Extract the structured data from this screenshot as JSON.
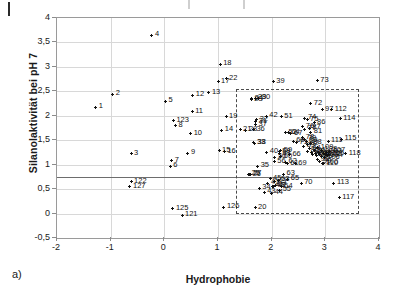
{
  "figure": {
    "panel_label": "a)"
  },
  "chart_data": {
    "type": "scatter",
    "title": "",
    "xlabel": "Hydrophobie",
    "ylabel": "Silanolaktivität bei pH 7",
    "xlim": [
      -2,
      4
    ],
    "ylim": [
      -0.5,
      4
    ],
    "xticks": [
      "-2",
      "-1",
      "0",
      "1",
      "2",
      "3",
      "4"
    ],
    "xtick_values": [
      -2,
      -1,
      0,
      1,
      2,
      3,
      4
    ],
    "yticks": [
      "-0,5",
      "0",
      "0,5",
      "1",
      "1,5",
      "2",
      "2,5",
      "3",
      "3,5",
      "4"
    ],
    "ytick_values": [
      -0.5,
      0,
      0.5,
      1,
      1.5,
      2,
      2.5,
      3,
      3.5,
      4
    ],
    "grid": true,
    "legend": "none",
    "annotations": [
      {
        "type": "hline",
        "name": "threshold-line",
        "y": 0.75,
        "style": "solid"
      },
      {
        "type": "rect",
        "name": "selection-box",
        "x0": 1.33,
        "x1": 3.63,
        "y0": 0.0,
        "y1": 2.55,
        "style": "dashed"
      }
    ],
    "point_label_format": "number",
    "points": [
      {
        "label": "1",
        "x": -1.28,
        "y": 2.17
      },
      {
        "label": "2",
        "x": -0.96,
        "y": 2.44
      },
      {
        "label": "3",
        "x": -0.62,
        "y": 1.22
      },
      {
        "label": "4",
        "x": -0.23,
        "y": 3.65
      },
      {
        "label": "5",
        "x": 0.02,
        "y": 2.3
      },
      {
        "label": "6",
        "x": 0.11,
        "y": 0.97
      },
      {
        "label": "7",
        "x": 0.14,
        "y": 1.08
      },
      {
        "label": "8",
        "x": 0.21,
        "y": 1.8
      },
      {
        "label": "9",
        "x": 0.44,
        "y": 1.23
      },
      {
        "label": "10",
        "x": 0.49,
        "y": 1.63
      },
      {
        "label": "11",
        "x": 0.52,
        "y": 2.08
      },
      {
        "label": "12",
        "x": 0.53,
        "y": 2.42
      },
      {
        "label": "13",
        "x": 0.83,
        "y": 2.47
      },
      {
        "label": "14",
        "x": 1.07,
        "y": 1.7
      },
      {
        "label": "15",
        "x": 1.02,
        "y": 1.28
      },
      {
        "label": "16",
        "x": 1.12,
        "y": 1.26
      },
      {
        "label": "17",
        "x": 1.0,
        "y": 2.7
      },
      {
        "label": "18",
        "x": 1.04,
        "y": 3.05
      },
      {
        "label": "19",
        "x": 1.15,
        "y": 1.98
      },
      {
        "label": "20",
        "x": 1.69,
        "y": 0.12
      },
      {
        "label": "21",
        "x": 1.41,
        "y": 1.71
      },
      {
        "label": "22",
        "x": 1.15,
        "y": 2.76
      },
      {
        "label": "23",
        "x": 1.62,
        "y": 2.33
      },
      {
        "label": "24",
        "x": 1.63,
        "y": 2.35
      },
      {
        "label": "25",
        "x": 1.57,
        "y": 0.8
      },
      {
        "label": "26",
        "x": 1.59,
        "y": 0.79
      },
      {
        "label": "27",
        "x": 1.6,
        "y": 0.8
      },
      {
        "label": "28",
        "x": 1.52,
        "y": 1.7
      },
      {
        "label": "29",
        "x": 1.69,
        "y": 2.36
      },
      {
        "label": "30",
        "x": 1.76,
        "y": 2.36
      },
      {
        "label": "31",
        "x": 1.7,
        "y": 1.88
      },
      {
        "label": "32",
        "x": 1.72,
        "y": 1.92
      },
      {
        "label": "33",
        "x": 1.67,
        "y": 1.45
      },
      {
        "label": "34",
        "x": 1.77,
        "y": 0.52
      },
      {
        "label": "35",
        "x": 1.74,
        "y": 0.97
      },
      {
        "label": "36",
        "x": 1.66,
        "y": 1.71
      },
      {
        "label": "37",
        "x": 1.7,
        "y": 1.82
      },
      {
        "label": "38",
        "x": 1.68,
        "y": 1.44
      },
      {
        "label": "39",
        "x": 2.03,
        "y": 2.7
      },
      {
        "label": "40",
        "x": 1.91,
        "y": 1.25
      },
      {
        "label": "41",
        "x": 1.93,
        "y": 0.62
      },
      {
        "label": "42",
        "x": 1.9,
        "y": 1.99
      },
      {
        "label": "43",
        "x": 1.86,
        "y": 0.44
      },
      {
        "label": "44",
        "x": 2.0,
        "y": 0.42
      },
      {
        "label": "45",
        "x": 1.97,
        "y": 0.71
      },
      {
        "label": "46",
        "x": 2.02,
        "y": 0.56
      },
      {
        "label": "47",
        "x": 2.07,
        "y": 0.57
      },
      {
        "label": "48",
        "x": 2.04,
        "y": 0.56
      },
      {
        "label": "49",
        "x": 2.06,
        "y": 0.65
      },
      {
        "label": "50",
        "x": 2.06,
        "y": 1.15
      },
      {
        "label": "51",
        "x": 2.18,
        "y": 1.98
      },
      {
        "label": "52",
        "x": 2.26,
        "y": 1.65
      },
      {
        "label": "53",
        "x": 2.12,
        "y": 0.68
      },
      {
        "label": "54",
        "x": 2.18,
        "y": 0.55
      },
      {
        "label": "55",
        "x": 2.15,
        "y": 0.48
      },
      {
        "label": "56",
        "x": 2.05,
        "y": 1.06
      },
      {
        "label": "57",
        "x": 2.14,
        "y": 1.22
      },
      {
        "label": "58",
        "x": 2.14,
        "y": 1.26
      },
      {
        "label": "59",
        "x": 2.17,
        "y": 1.28
      },
      {
        "label": "60",
        "x": 2.17,
        "y": 1.16
      },
      {
        "label": "61",
        "x": 2.29,
        "y": 1.02
      },
      {
        "label": "62",
        "x": 2.26,
        "y": 1.05
      },
      {
        "label": "63",
        "x": 2.22,
        "y": 0.8
      },
      {
        "label": "64",
        "x": 2.31,
        "y": 1.65
      },
      {
        "label": "65",
        "x": 2.3,
        "y": 0.7
      },
      {
        "label": "66",
        "x": 2.33,
        "y": 1.2
      },
      {
        "label": "67",
        "x": 2.36,
        "y": 1.63
      },
      {
        "label": "68",
        "x": 2.4,
        "y": 1.48
      },
      {
        "label": "69",
        "x": 2.44,
        "y": 1.02
      },
      {
        "label": "70",
        "x": 2.55,
        "y": 0.62
      },
      {
        "label": "71",
        "x": 2.46,
        "y": 1.45
      },
      {
        "label": "72",
        "x": 2.73,
        "y": 2.25
      },
      {
        "label": "73",
        "x": 2.85,
        "y": 2.72
      },
      {
        "label": "74",
        "x": 2.62,
        "y": 1.95
      },
      {
        "label": "75",
        "x": 2.66,
        "y": 1.92
      },
      {
        "label": "76",
        "x": 2.58,
        "y": 1.78
      },
      {
        "label": "77",
        "x": 2.62,
        "y": 1.72
      },
      {
        "label": "78",
        "x": 2.58,
        "y": 1.55
      },
      {
        "label": "79",
        "x": 2.62,
        "y": 1.52
      },
      {
        "label": "80",
        "x": 2.64,
        "y": 1.48
      },
      {
        "label": "81",
        "x": 2.73,
        "y": 1.66
      },
      {
        "label": "82",
        "x": 2.66,
        "y": 1.42
      },
      {
        "label": "83",
        "x": 2.6,
        "y": 1.38
      },
      {
        "label": "84",
        "x": 2.7,
        "y": 1.33
      },
      {
        "label": "85",
        "x": 2.67,
        "y": 1.27
      },
      {
        "label": "86",
        "x": 2.79,
        "y": 1.86
      },
      {
        "label": "87",
        "x": 2.7,
        "y": 1.75
      },
      {
        "label": "88",
        "x": 2.72,
        "y": 1.44
      },
      {
        "label": "89",
        "x": 2.74,
        "y": 1.25
      },
      {
        "label": "90",
        "x": 2.76,
        "y": 1.2
      },
      {
        "label": "91",
        "x": 2.8,
        "y": 1.28
      },
      {
        "label": "92",
        "x": 2.82,
        "y": 1.22
      },
      {
        "label": "93",
        "x": 2.84,
        "y": 1.18
      },
      {
        "label": "94",
        "x": 2.88,
        "y": 1.24
      },
      {
        "label": "95",
        "x": 2.9,
        "y": 1.2
      },
      {
        "label": "96",
        "x": 2.92,
        "y": 1.16
      },
      {
        "label": "97",
        "x": 2.94,
        "y": 2.12
      },
      {
        "label": "98",
        "x": 2.86,
        "y": 1.1
      },
      {
        "label": "99",
        "x": 2.9,
        "y": 1.06
      },
      {
        "label": "100",
        "x": 2.95,
        "y": 1.03
      },
      {
        "label": "101",
        "x": 2.97,
        "y": 1.22
      },
      {
        "label": "102",
        "x": 3.0,
        "y": 1.2
      },
      {
        "label": "103",
        "x": 3.02,
        "y": 1.25
      },
      {
        "label": "104",
        "x": 3.04,
        "y": 1.18
      },
      {
        "label": "105",
        "x": 3.06,
        "y": 1.21
      },
      {
        "label": "106",
        "x": 2.98,
        "y": 1.14
      },
      {
        "label": "107",
        "x": 3.08,
        "y": 1.27
      },
      {
        "label": "108",
        "x": 2.93,
        "y": 1.3
      },
      {
        "label": "109",
        "x": 2.86,
        "y": 1.35
      },
      {
        "label": "110",
        "x": 2.96,
        "y": 1.02
      },
      {
        "label": "111",
        "x": 3.05,
        "y": 1.48
      },
      {
        "label": "112",
        "x": 3.12,
        "y": 2.12
      },
      {
        "label": "113",
        "x": 3.16,
        "y": 0.62
      },
      {
        "label": "114",
        "x": 3.28,
        "y": 1.94
      },
      {
        "label": "115",
        "x": 3.3,
        "y": 1.52
      },
      {
        "label": "117",
        "x": 3.26,
        "y": 0.32
      },
      {
        "label": "118",
        "x": 3.38,
        "y": 1.22
      },
      {
        "label": "121",
        "x": 0.33,
        "y": -0.03
      },
      {
        "label": "122",
        "x": -0.62,
        "y": 0.65
      },
      {
        "label": "123",
        "x": 0.17,
        "y": 1.9
      },
      {
        "label": "125",
        "x": 0.16,
        "y": 0.1
      },
      {
        "label": "126",
        "x": 1.11,
        "y": 0.13
      },
      {
        "label": "127",
        "x": -0.64,
        "y": 0.55
      }
    ]
  }
}
